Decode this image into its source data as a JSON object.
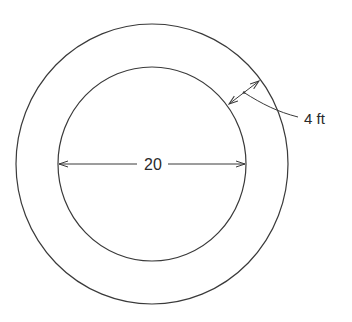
{
  "diagram": {
    "type": "concentric-circles",
    "stroke_color": "#3a3a3a",
    "background": "#ffffff",
    "inner_circle": {
      "diameter_label": "20"
    },
    "ring": {
      "width_label": "4 ft"
    }
  }
}
